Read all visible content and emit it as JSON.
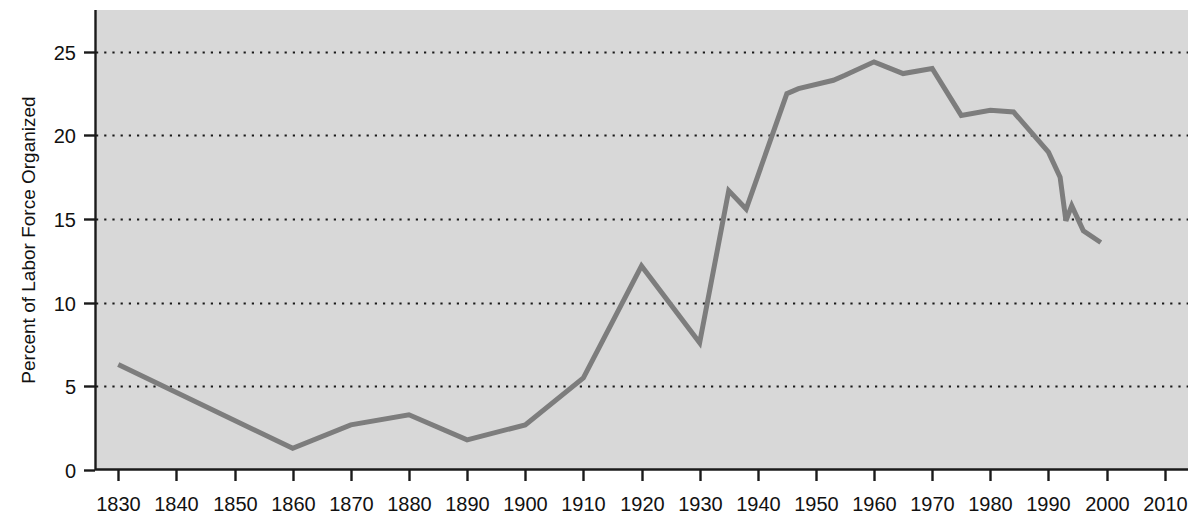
{
  "chart_data": {
    "type": "line",
    "title": "",
    "subtitle": "",
    "xlabel": "",
    "ylabel": "Percent of Labor Force Organized",
    "xlim": [
      1826,
      2014
    ],
    "ylim": [
      0,
      27.5
    ],
    "grid": true,
    "grid_style": "dotted-horizontal",
    "legend": "none",
    "xticks": [
      1830,
      1840,
      1850,
      1860,
      1870,
      1880,
      1890,
      1900,
      1910,
      1920,
      1930,
      1940,
      1950,
      1960,
      1970,
      1980,
      1990,
      2000,
      2010
    ],
    "xtick_labels": [
      "1830",
      "1840",
      "1850",
      "1860",
      "1870",
      "1880",
      "1890",
      "1900",
      "1910",
      "1920",
      "1930",
      "1940",
      "1950",
      "1960",
      "1970",
      "1980",
      "1990",
      "2000",
      "2010"
    ],
    "yticks": [
      0,
      5,
      10,
      15,
      20,
      25
    ],
    "ytick_labels": [
      "0",
      "5",
      "10",
      "15",
      "20",
      "25"
    ],
    "gridlines_y": [
      5,
      10,
      15,
      20,
      25
    ],
    "series": [
      {
        "name": "Percent of Labor Force Organized",
        "color": "#7d7d7d",
        "line_width": 5,
        "x": [
          1830,
          1860,
          1870,
          1880,
          1890,
          1900,
          1910,
          1920,
          1930,
          1935,
          1938,
          1945,
          1947,
          1953,
          1955,
          1960,
          1965,
          1970,
          1975,
          1980,
          1984,
          1990,
          1992,
          1993,
          1994,
          1996,
          1999
        ],
        "y": [
          6.3,
          1.3,
          2.7,
          3.3,
          1.8,
          2.7,
          5.5,
          12.2,
          7.6,
          16.7,
          15.6,
          22.5,
          22.8,
          23.3,
          23.6,
          24.4,
          23.7,
          24.0,
          21.2,
          21.5,
          21.4,
          19.0,
          17.5,
          14.9,
          15.8,
          14.3,
          13.6
        ]
      }
    ]
  },
  "colors": {
    "page_background": "#ffffff",
    "plot_background": "#d8d8d8",
    "axis": "#1a1a1a",
    "grid": "#1a1a1a",
    "line": "#7d7d7d",
    "text": "#111111"
  },
  "geometry": {
    "plot_left": 95,
    "plot_right": 1188,
    "plot_top": 10,
    "plot_bottom": 470,
    "px_per_decade": 59.4,
    "px_per_5_percent": 75.8
  }
}
